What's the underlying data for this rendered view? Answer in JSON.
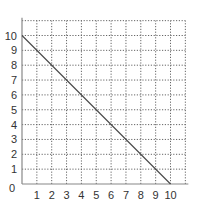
{
  "chart_data": {
    "type": "line",
    "title": "",
    "xlabel": "",
    "ylabel": "",
    "xlim": [
      0,
      11
    ],
    "ylim": [
      0,
      11
    ],
    "grid": true,
    "grid_style": "dotted",
    "x_ticks": [
      "1",
      "2",
      "3",
      "4",
      "5",
      "6",
      "7",
      "8",
      "9",
      "10"
    ],
    "y_ticks": [
      "0",
      "1",
      "2",
      "3",
      "4",
      "5",
      "6",
      "7",
      "8",
      "9",
      "10"
    ],
    "series": [
      {
        "name": "line",
        "x": [
          0,
          10
        ],
        "y": [
          10,
          0
        ]
      }
    ],
    "colors": {
      "line": "#444444",
      "axis": "#888888",
      "grid": "#666666",
      "text": "#333333"
    }
  }
}
